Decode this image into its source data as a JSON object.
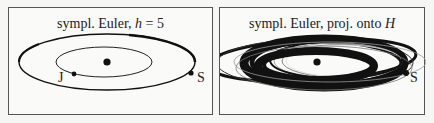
{
  "panels": [
    {
      "title_prefix": "sympl. Euler, ",
      "title_var": "h",
      "title_suffix": " = 5",
      "labels": {
        "jupiter": "J",
        "saturn": "S"
      }
    },
    {
      "title_prefix": "sympl. Euler, proj. onto ",
      "title_var": "H",
      "title_suffix": "",
      "labels": {
        "saturn": "S"
      }
    }
  ],
  "colors": {
    "ink": "#111111",
    "frame": "#555555",
    "background": "#fafaf8"
  }
}
